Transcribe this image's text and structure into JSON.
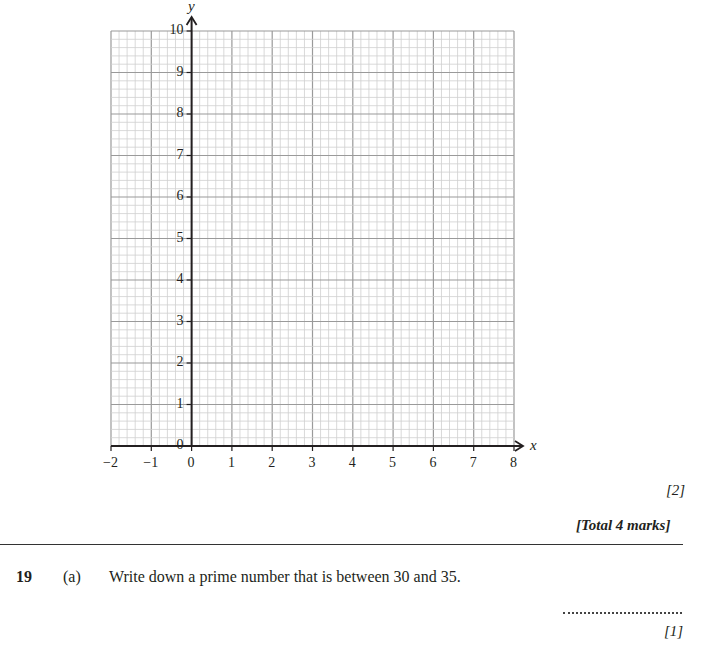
{
  "chart_data": {
    "type": "scatter",
    "title": "",
    "xlabel": "x",
    "ylabel": "y",
    "xlim": [
      -2,
      8
    ],
    "ylim": [
      0,
      10
    ],
    "x_ticks": [
      "−2",
      "−1",
      "0",
      "1",
      "2",
      "3",
      "4",
      "5",
      "6",
      "7",
      "8"
    ],
    "y_ticks": [
      "0",
      "1",
      "2",
      "3",
      "4",
      "5",
      "6",
      "7",
      "8",
      "9",
      "10"
    ],
    "grid": true,
    "grid_minor_step": 0.2,
    "grid_major_step": 1,
    "series": [],
    "note": "Blank graph-paper grid for plotting; no data plotted"
  },
  "graph": {
    "x_axis_name": "x",
    "y_axis_name": "y",
    "x_tick_labels": [
      "−2",
      "−1",
      "0",
      "1",
      "2",
      "3",
      "4",
      "5",
      "6",
      "7",
      "8"
    ],
    "y_tick_labels": [
      "0",
      "1",
      "2",
      "3",
      "4",
      "5",
      "6",
      "7",
      "8",
      "9",
      "10"
    ]
  },
  "marks": {
    "part_marks": "[2]",
    "total_marks": "[Total 4 marks]"
  },
  "question": {
    "number": "19",
    "part": "(a)",
    "text": "Write down a prime number that is between 30 and 35.",
    "answer_value": "",
    "marks": "[1]"
  }
}
